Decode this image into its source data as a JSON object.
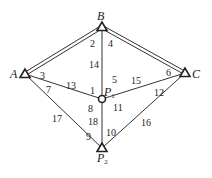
{
  "diagram": {
    "points": [
      {
        "id": "A",
        "label": "A",
        "sub": "",
        "x": 25,
        "y": 74,
        "type": "triangle",
        "lx": 10,
        "ly": 78
      },
      {
        "id": "B",
        "label": "B",
        "sub": "",
        "x": 102,
        "y": 27,
        "type": "triangle",
        "lx": 97,
        "ly": 20
      },
      {
        "id": "C",
        "label": "C",
        "sub": "",
        "x": 185,
        "y": 73,
        "type": "triangle",
        "lx": 192,
        "ly": 78
      },
      {
        "id": "P1",
        "label": "P",
        "sub": "1",
        "x": 102,
        "y": 99,
        "type": "circle",
        "lx": 104,
        "ly": 96
      },
      {
        "id": "P2",
        "label": "P",
        "sub": "2",
        "x": 102,
        "y": 148,
        "type": "triangle",
        "lx": 97,
        "ly": 162
      }
    ],
    "edges": [
      {
        "from": "A",
        "to": "B",
        "double": true
      },
      {
        "from": "B",
        "to": "C",
        "double": true
      },
      {
        "from": "B",
        "to": "P1",
        "double": false
      },
      {
        "from": "A",
        "to": "P1",
        "double": false
      },
      {
        "from": "C",
        "to": "P1",
        "double": false
      },
      {
        "from": "P1",
        "to": "P2",
        "double": false
      },
      {
        "from": "A",
        "to": "P2",
        "double": false
      },
      {
        "from": "C",
        "to": "P2",
        "double": false
      }
    ],
    "angle_labels": [
      {
        "text": "1",
        "x": 90,
        "y": 94
      },
      {
        "text": "2",
        "x": 90,
        "y": 47
      },
      {
        "text": "3",
        "x": 40,
        "y": 79
      },
      {
        "text": "4",
        "x": 108,
        "y": 47
      },
      {
        "text": "5",
        "x": 112,
        "y": 83
      },
      {
        "text": "6",
        "x": 166,
        "y": 76
      },
      {
        "text": "7",
        "x": 46,
        "y": 93
      },
      {
        "text": "8",
        "x": 88,
        "y": 112
      },
      {
        "text": "9",
        "x": 86,
        "y": 140
      },
      {
        "text": "10",
        "x": 106,
        "y": 136
      },
      {
        "text": "11",
        "x": 113,
        "y": 111
      },
      {
        "text": "12",
        "x": 154,
        "y": 96
      },
      {
        "text": "13",
        "x": 66,
        "y": 89
      },
      {
        "text": "14",
        "x": 89,
        "y": 68
      },
      {
        "text": "15",
        "x": 131,
        "y": 84
      },
      {
        "text": "16",
        "x": 141,
        "y": 126
      },
      {
        "text": "17",
        "x": 52,
        "y": 122
      },
      {
        "text": "18",
        "x": 88,
        "y": 125
      }
    ]
  }
}
